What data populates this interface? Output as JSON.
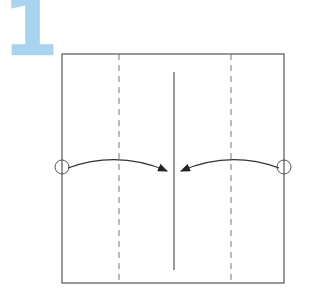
{
  "step": {
    "number": "1",
    "color": "#a9d4f0"
  },
  "diagram": {
    "type": "origami-fold-step",
    "paper": {
      "shape": "square",
      "x": 62,
      "y": 54,
      "width": 222,
      "height": 229,
      "stroke": "#555555"
    },
    "crease_lines": [
      {
        "kind": "valley-dashed",
        "x": 119,
        "y1": 54,
        "y2": 283
      },
      {
        "kind": "valley-dashed",
        "x": 231,
        "y1": 54,
        "y2": 283
      }
    ],
    "center_line": {
      "kind": "solid",
      "x": 174,
      "y1": 72,
      "y2": 270
    },
    "arrows": [
      {
        "from_marker": "left-edge-circle",
        "from": [
          66,
          167
        ],
        "to": [
          167,
          171
        ],
        "direction": "right"
      },
      {
        "from_marker": "right-edge-circle",
        "from": [
          281,
          167
        ],
        "to": [
          181,
          171
        ],
        "direction": "left"
      }
    ],
    "markers": [
      {
        "kind": "circle",
        "cx": 62,
        "cy": 167,
        "r": 7
      },
      {
        "kind": "circle",
        "cx": 284,
        "cy": 167,
        "r": 7
      }
    ]
  }
}
